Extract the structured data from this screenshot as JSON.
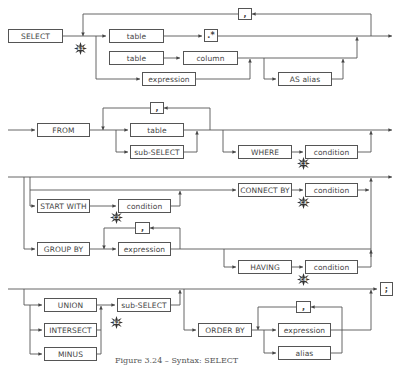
{
  "diagram": {
    "caption": "Figure 3.24 – Syntax: SELECT",
    "sections": {
      "select": {
        "keyword": "SELECT",
        "repeat_separator": ",",
        "items": {
          "table_star": {
            "table": "table",
            "star": ".*"
          },
          "table_column": {
            "table": "table",
            "column": "column"
          },
          "expression": "expression",
          "alias": "AS alias"
        },
        "marker": "E1"
      },
      "from": {
        "keyword": "FROM",
        "repeat_separator": ",",
        "table": "table",
        "subselect": "sub-SELECT",
        "where_keyword": "WHERE",
        "where_condition": "condition",
        "marker": "C1"
      },
      "hierarchy": {
        "start_with_keyword": "START WITH",
        "start_with_condition": "condition",
        "start_marker": "C2",
        "connect_by_keyword": "CONNECT BY",
        "connect_by_condition": "condition",
        "connect_marker": "C3"
      },
      "group": {
        "keyword": "GROUP BY",
        "repeat_separator": ",",
        "expression": "expression",
        "having_keyword": "HAVING",
        "having_condition": "condition",
        "marker": "C4"
      },
      "set_ops": {
        "union": "UNION",
        "intersect": "INTERSECT",
        "minus": "MINUS",
        "subselect": "sub-SELECT",
        "marker": "E2"
      },
      "order": {
        "keyword": "ORDER BY",
        "repeat_separator": ",",
        "expression": "expression",
        "alias": "alias",
        "terminator": ";"
      }
    }
  }
}
